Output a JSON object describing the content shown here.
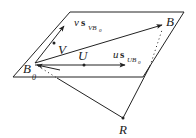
{
  "diagram": {
    "labels": {
      "B0": "B",
      "B0_sub": "0",
      "B": "B",
      "V": "V",
      "U": "U",
      "R": "R",
      "v_coef": "v",
      "v_s": "s",
      "v_sub": "VB",
      "v_sub0": "0",
      "u_coef": "u",
      "u_s": "s",
      "u_sub": "UB",
      "u_sub0": "0"
    },
    "colors": {
      "stroke": "#222222",
      "background": "#ffffff"
    }
  }
}
